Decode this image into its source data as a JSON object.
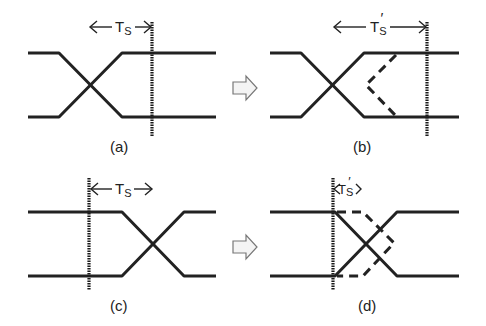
{
  "figure": {
    "panels": [
      {
        "id": "a",
        "label": "(a)",
        "interval_label": "T",
        "interval_sub": "S",
        "prime": ""
      },
      {
        "id": "b",
        "label": "(b)",
        "interval_label": "T",
        "interval_sub": "S",
        "prime": "′"
      },
      {
        "id": "c",
        "label": "(c)",
        "interval_label": "T",
        "interval_sub": "S",
        "prime": ""
      },
      {
        "id": "d",
        "label": "(d)",
        "interval_label": "T",
        "interval_sub": "S",
        "prime": "′"
      }
    ],
    "transition_arrows": [
      {
        "from": "a",
        "to": "b",
        "icon": "block-right-arrow-icon"
      },
      {
        "from": "c",
        "to": "d",
        "icon": "block-right-arrow-icon"
      }
    ],
    "colors": {
      "line": "#222222",
      "arrow_fill": "#f4f4f4",
      "arrow_stroke": "#777777",
      "background": "#ffffff"
    }
  }
}
